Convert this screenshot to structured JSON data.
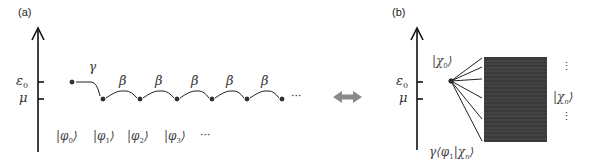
{
  "panel_a": {
    "label": "(a)",
    "axis": {
      "ticks": [
        {
          "name": "ε",
          "sub": "0"
        },
        {
          "name": "μ",
          "sub": ""
        }
      ]
    },
    "coupling_first": "γ",
    "coupling_chain": [
      "β",
      "β",
      "β",
      "β",
      "β"
    ],
    "trailing_ellipsis": "···",
    "states": [
      {
        "sym": "φ",
        "sub": "0"
      },
      {
        "sym": "φ",
        "sub": "1"
      },
      {
        "sym": "φ",
        "sub": "2"
      },
      {
        "sym": "φ",
        "sub": "3"
      }
    ],
    "states_ellipsis": "···"
  },
  "equivalence_arrow": {
    "color": "#8a8a8a"
  },
  "panel_b": {
    "label": "(b)",
    "axis": {
      "ticks": [
        {
          "name": "ε",
          "sub": "0"
        },
        {
          "name": "μ",
          "sub": ""
        }
      ]
    },
    "impurity_state": {
      "sym": "χ",
      "sub": "0"
    },
    "continuum_state": {
      "sym": "χ",
      "sub": "n"
    },
    "continuum_color": "#3a3a3a",
    "coupling_prefix": "γ",
    "coupling_bra": {
      "sym": "φ",
      "sub": "1"
    },
    "coupling_ket": {
      "sym": "χ",
      "sub": "n"
    },
    "vertical_ellipsis": "⋮"
  }
}
